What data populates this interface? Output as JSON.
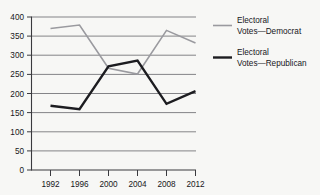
{
  "chart_data": {
    "type": "line",
    "title": "",
    "xlabel": "",
    "ylabel": "",
    "categories": [
      "1992",
      "1996",
      "2000",
      "2004",
      "2008",
      "2012"
    ],
    "x": [
      1992,
      1996,
      2000,
      2004,
      2008,
      2012
    ],
    "series": [
      {
        "name": "Electoral Votes—Democrat",
        "color": "#9a9a9f",
        "values": [
          370,
          379,
          266,
          251,
          365,
          332
        ]
      },
      {
        "name": "Electoral Votes—Republican",
        "color": "#1c1c20",
        "values": [
          168,
          159,
          271,
          286,
          173,
          206
        ]
      }
    ],
    "ylim": [
      0,
      400
    ],
    "yticks": [
      0,
      50,
      100,
      150,
      200,
      250,
      300,
      350,
      400
    ],
    "ytick_labels": [
      "0",
      "50",
      "100",
      "150",
      "200",
      "250",
      "300",
      "350",
      "400"
    ],
    "xtick_labels": [
      "1992",
      "1996",
      "2000",
      "2004",
      "2008",
      "2012"
    ],
    "grid": true,
    "grid_axis": "y",
    "legend_position": "right"
  },
  "legend": {
    "entries": [
      {
        "line1": "Electoral",
        "line2": "Votes—Democrat",
        "color": "#9a9a9f",
        "swatch_name": "legend-swatch-democrat"
      },
      {
        "line1": "Electoral",
        "line2": "Votes—Republican",
        "color": "#1c1c20",
        "swatch_name": "legend-swatch-republican"
      }
    ]
  },
  "axes": {
    "y_tick_labels": [
      "400",
      "350",
      "300",
      "250",
      "200",
      "150",
      "100",
      "50",
      "0"
    ],
    "x_tick_labels": [
      "1992",
      "1996",
      "2000",
      "2004",
      "2008",
      "2012"
    ]
  }
}
